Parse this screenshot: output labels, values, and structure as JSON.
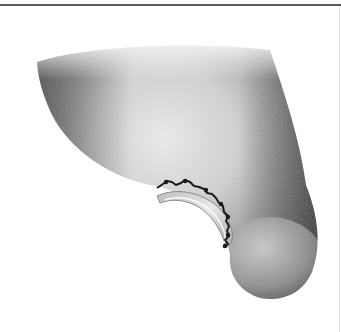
{
  "figure": {
    "alt": "Illustration of a limb stump with a sutured wound and a cuff ring",
    "colors": {
      "frame_line": "#5a5a5a",
      "skin_dark": "#3a3a3a",
      "skin_mid": "#9a9a9a",
      "skin_light": "#e6e6e6",
      "suture": "#1a1a1a",
      "cuff": "#d4d4d4"
    }
  }
}
